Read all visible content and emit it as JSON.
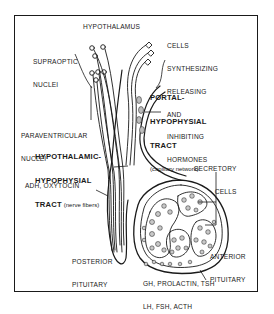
{
  "diagram": {
    "labels": {
      "hypothalamus": "HYPOTHALAMUS",
      "supraoptic": [
        "SUPRAOPTIC",
        "NUCLEI"
      ],
      "cells_synthesizing": [
        "CELLS",
        "SYNTHESIZING",
        "RELEASING",
        "AND",
        "INHIBITING",
        "HORMONES"
      ],
      "portal_tract": [
        "PORTAL-",
        "HYPOPHYSIAL",
        "TRACT"
      ],
      "portal_tract_note": "(capillary network)",
      "paraventricular": [
        "PARAVENTRICULAR",
        "NUCLEI"
      ],
      "hypothalamic_tract": [
        "HYPOTHALAMIC-",
        "HYPOPHYSIAL",
        "TRACT"
      ],
      "hypothalamic_tract_note": "(nerve fibers)",
      "posterior_hormones": "ADH, OXYTOCIN",
      "secretory_cells": [
        "SECRETORY",
        "CELLS"
      ],
      "posterior_pituitary": [
        "POSTERIOR",
        "PITUITARY"
      ],
      "anterior_pituitary": [
        "ANTERIOR",
        "PITUITARY"
      ],
      "anterior_hormones": [
        "GH, PROLACTIN, TSH",
        "LH, FSH, ACTH"
      ]
    },
    "colors": {
      "ink": "#1a1a1a",
      "background": "#ffffff",
      "cell_fill": "#bdbdbd"
    }
  }
}
